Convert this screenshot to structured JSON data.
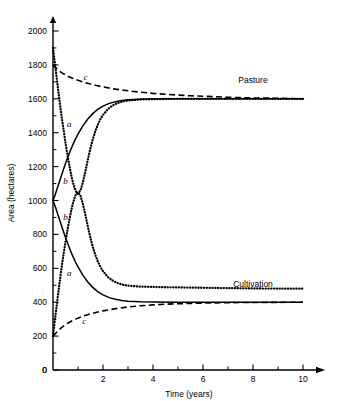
{
  "chart_data": {
    "type": "line",
    "title": "",
    "xlabel": "Time (years)",
    "ylabel": "Area (hectares)",
    "xlim": [
      0,
      10
    ],
    "ylim": [
      0,
      2000
    ],
    "grid": false,
    "legend_position": "inline-right",
    "x_ticks_major": [
      0,
      2,
      4,
      6,
      8,
      10
    ],
    "x_tick_labels": [
      "0",
      "2",
      "4",
      "6",
      "8",
      "10"
    ],
    "x_ticks_minor": [
      1,
      3,
      5,
      7,
      9
    ],
    "y_ticks_major": [
      0,
      200,
      400,
      600,
      800,
      1000,
      1200,
      1400,
      1600,
      1800,
      2000
    ],
    "y_tick_labels": [
      "0",
      "200",
      "400",
      "600",
      "800",
      "1000",
      "1200",
      "1400",
      "1600",
      "1800",
      "2000"
    ],
    "y_ticks_minor": [
      100,
      300,
      500,
      700,
      900,
      1100,
      1300,
      1500,
      1700,
      1900
    ],
    "annotations": [
      {
        "text": "Pasture",
        "x": 8.0,
        "y": 1710,
        "name": "pasture-group-label"
      },
      {
        "text": "Cultivation",
        "x": 8.0,
        "y": 510,
        "name": "cultivation-group-label"
      },
      {
        "text": "c",
        "x": 1.3,
        "y": 1730,
        "name": "curve-label-c-pasture"
      },
      {
        "text": "a",
        "x": 0.65,
        "y": 1450,
        "name": "curve-label-a-pasture"
      },
      {
        "text": "b",
        "x": 0.5,
        "y": 1115,
        "name": "curve-label-b-pasture"
      },
      {
        "text": "b",
        "x": 0.5,
        "y": 900,
        "name": "curve-label-b-cultivation"
      },
      {
        "text": "a",
        "x": 0.65,
        "y": 570,
        "name": "curve-label-a-cultivation"
      },
      {
        "text": "c",
        "x": 1.25,
        "y": 290,
        "name": "curve-label-c-cultivation"
      }
    ],
    "series": [
      {
        "name": "a-pasture",
        "label": "a",
        "group": "Pasture",
        "style": "dotted",
        "color": "#000000",
        "start_value": 1900,
        "end_value": 1600,
        "points": [
          [
            0.0,
            1900
          ],
          [
            0.05,
            1840
          ],
          [
            0.1,
            1780
          ],
          [
            0.15,
            1720
          ],
          [
            0.2,
            1660
          ],
          [
            0.25,
            1600
          ],
          [
            0.3,
            1545
          ],
          [
            0.35,
            1490
          ],
          [
            0.4,
            1440
          ],
          [
            0.45,
            1390
          ],
          [
            0.5,
            1340
          ],
          [
            0.55,
            1295
          ],
          [
            0.6,
            1250
          ],
          [
            0.65,
            1210
          ],
          [
            0.7,
            1170
          ],
          [
            0.75,
            1135
          ],
          [
            0.8,
            1105
          ],
          [
            0.85,
            1080
          ],
          [
            0.9,
            1060
          ],
          [
            0.95,
            1045
          ],
          [
            1.0,
            1040
          ],
          [
            1.1,
            1060
          ],
          [
            1.2,
            1110
          ],
          [
            1.3,
            1175
          ],
          [
            1.4,
            1245
          ],
          [
            1.5,
            1310
          ],
          [
            1.6,
            1365
          ],
          [
            1.7,
            1412
          ],
          [
            1.8,
            1450
          ],
          [
            1.9,
            1481
          ],
          [
            2.0,
            1505
          ],
          [
            2.2,
            1540
          ],
          [
            2.4,
            1562
          ],
          [
            2.6,
            1576
          ],
          [
            2.8,
            1585
          ],
          [
            3.0,
            1590
          ],
          [
            3.5,
            1596
          ],
          [
            4.0,
            1598
          ],
          [
            5.0,
            1600
          ],
          [
            6.0,
            1600
          ],
          [
            7.0,
            1600
          ],
          [
            8.0,
            1600
          ],
          [
            9.0,
            1600
          ],
          [
            10.0,
            1600
          ]
        ]
      },
      {
        "name": "b-pasture",
        "label": "b",
        "group": "Pasture",
        "style": "solid",
        "color": "#000000",
        "start_value": 1000,
        "end_value": 1600,
        "points": [
          [
            0.0,
            1000
          ],
          [
            0.1,
            1040
          ],
          [
            0.2,
            1085
          ],
          [
            0.3,
            1130
          ],
          [
            0.4,
            1175
          ],
          [
            0.5,
            1218
          ],
          [
            0.6,
            1258
          ],
          [
            0.7,
            1296
          ],
          [
            0.8,
            1331
          ],
          [
            0.9,
            1363
          ],
          [
            1.0,
            1392
          ],
          [
            1.2,
            1442
          ],
          [
            1.4,
            1482
          ],
          [
            1.6,
            1514
          ],
          [
            1.8,
            1539
          ],
          [
            2.0,
            1557
          ],
          [
            2.25,
            1573
          ],
          [
            2.5,
            1583
          ],
          [
            2.75,
            1590
          ],
          [
            3.0,
            1594
          ],
          [
            3.5,
            1598
          ],
          [
            4.0,
            1599
          ],
          [
            5.0,
            1600
          ],
          [
            6.0,
            1600
          ],
          [
            7.0,
            1600
          ],
          [
            8.0,
            1600
          ],
          [
            9.0,
            1600
          ],
          [
            10.0,
            1600
          ]
        ]
      },
      {
        "name": "c-pasture",
        "label": "c",
        "group": "Pasture",
        "style": "dashed",
        "color": "#000000",
        "start_value": 1800,
        "end_value": 1600,
        "points": [
          [
            0.0,
            1800
          ],
          [
            0.2,
            1770
          ],
          [
            0.4,
            1749
          ],
          [
            0.6,
            1733
          ],
          [
            0.8,
            1720
          ],
          [
            1.0,
            1709
          ],
          [
            1.25,
            1697
          ],
          [
            1.5,
            1687
          ],
          [
            1.75,
            1678
          ],
          [
            2.0,
            1670
          ],
          [
            2.5,
            1657
          ],
          [
            3.0,
            1647
          ],
          [
            3.5,
            1639
          ],
          [
            4.0,
            1632
          ],
          [
            4.5,
            1627
          ],
          [
            5.0,
            1622
          ],
          [
            5.5,
            1618
          ],
          [
            6.0,
            1615
          ],
          [
            6.5,
            1612
          ],
          [
            7.0,
            1609
          ],
          [
            7.5,
            1607
          ],
          [
            8.0,
            1605
          ],
          [
            8.5,
            1604
          ],
          [
            9.0,
            1603
          ],
          [
            9.5,
            1601
          ],
          [
            10.0,
            1600
          ]
        ]
      },
      {
        "name": "a-cultivation",
        "label": "a",
        "group": "Cultivation",
        "style": "dotted",
        "color": "#000000",
        "start_value": 200,
        "end_value": 400,
        "points": [
          [
            0.0,
            200
          ],
          [
            0.05,
            262
          ],
          [
            0.1,
            322
          ],
          [
            0.15,
            382
          ],
          [
            0.2,
            442
          ],
          [
            0.25,
            500
          ],
          [
            0.3,
            556
          ],
          [
            0.35,
            610
          ],
          [
            0.4,
            662
          ],
          [
            0.45,
            710
          ],
          [
            0.5,
            756
          ],
          [
            0.55,
            800
          ],
          [
            0.6,
            843
          ],
          [
            0.65,
            883
          ],
          [
            0.7,
            920
          ],
          [
            0.75,
            954
          ],
          [
            0.8,
            985
          ],
          [
            0.85,
            1010
          ],
          [
            0.9,
            1030
          ],
          [
            0.95,
            1045
          ],
          [
            1.0,
            1048
          ],
          [
            1.1,
            1028
          ],
          [
            1.2,
            978
          ],
          [
            1.3,
            912
          ],
          [
            1.4,
            842
          ],
          [
            1.5,
            778
          ],
          [
            1.6,
            722
          ],
          [
            1.7,
            676
          ],
          [
            1.8,
            638
          ],
          [
            1.9,
            607
          ],
          [
            2.0,
            583
          ],
          [
            2.2,
            548
          ],
          [
            2.4,
            526
          ],
          [
            2.6,
            512
          ],
          [
            2.8,
            503
          ],
          [
            3.0,
            498
          ],
          [
            3.5,
            492
          ],
          [
            4.0,
            490
          ],
          [
            4.5,
            488
          ],
          [
            5.0,
            487
          ],
          [
            6.0,
            485
          ],
          [
            7.0,
            483
          ],
          [
            8.0,
            481
          ],
          [
            9.0,
            480
          ],
          [
            10.0,
            480
          ]
        ]
      },
      {
        "name": "b-cultivation",
        "label": "b",
        "group": "Cultivation",
        "style": "solid",
        "color": "#000000",
        "start_value": 1000,
        "end_value": 400,
        "points": [
          [
            0.0,
            1000
          ],
          [
            0.1,
            960
          ],
          [
            0.2,
            915
          ],
          [
            0.3,
            870
          ],
          [
            0.4,
            825
          ],
          [
            0.5,
            782
          ],
          [
            0.6,
            742
          ],
          [
            0.7,
            704
          ],
          [
            0.8,
            669
          ],
          [
            0.9,
            637
          ],
          [
            1.0,
            608
          ],
          [
            1.2,
            558
          ],
          [
            1.4,
            518
          ],
          [
            1.6,
            486
          ],
          [
            1.8,
            461
          ],
          [
            2.0,
            443
          ],
          [
            2.25,
            427
          ],
          [
            2.5,
            417
          ],
          [
            2.75,
            410
          ],
          [
            3.0,
            406
          ],
          [
            3.5,
            402
          ],
          [
            4.0,
            401
          ],
          [
            5.0,
            400
          ],
          [
            6.0,
            400
          ],
          [
            7.0,
            400
          ],
          [
            8.0,
            400
          ],
          [
            9.0,
            400
          ],
          [
            10.0,
            400
          ]
        ]
      },
      {
        "name": "c-cultivation",
        "label": "c",
        "group": "Cultivation",
        "style": "dashed",
        "color": "#000000",
        "start_value": 200,
        "end_value": 400,
        "points": [
          [
            0.0,
            200
          ],
          [
            0.2,
            232
          ],
          [
            0.4,
            257
          ],
          [
            0.6,
            277
          ],
          [
            0.8,
            293
          ],
          [
            1.0,
            306
          ],
          [
            1.25,
            320
          ],
          [
            1.5,
            331
          ],
          [
            1.75,
            341
          ],
          [
            2.0,
            349
          ],
          [
            2.5,
            362
          ],
          [
            3.0,
            372
          ],
          [
            3.5,
            379
          ],
          [
            4.0,
            384
          ],
          [
            4.5,
            388
          ],
          [
            5.0,
            391
          ],
          [
            5.5,
            393
          ],
          [
            6.0,
            395
          ],
          [
            6.5,
            396
          ],
          [
            7.0,
            397
          ],
          [
            7.5,
            398
          ],
          [
            8.0,
            398
          ],
          [
            8.5,
            399
          ],
          [
            9.0,
            399
          ],
          [
            9.5,
            400
          ],
          [
            10.0,
            400
          ]
        ]
      }
    ]
  },
  "geometry": {
    "origin_x_px": 53,
    "origin_y_px": 370,
    "x_unit_px": 25,
    "y_unit_px": 0.1695,
    "axis_top_px": 16,
    "axis_right_px": 325
  }
}
